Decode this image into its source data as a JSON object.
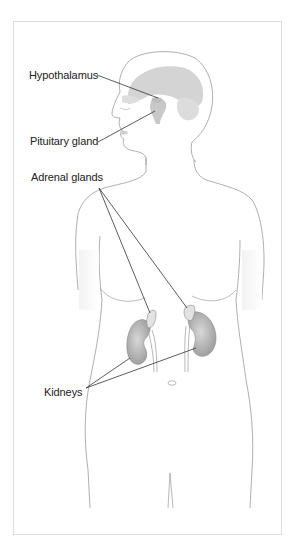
{
  "diagram": {
    "labels": {
      "hypothalamus": "Hypothalamus",
      "pituitary": "Pituitary gland",
      "adrenal": "Adrenal glands",
      "kidneys": "Kidneys"
    },
    "colors": {
      "outline": "#8a8a8a",
      "brain": "#cfcfcf",
      "organ": "#a9a9a9",
      "leader": "#333333",
      "frame": "#dcdcdc"
    }
  }
}
